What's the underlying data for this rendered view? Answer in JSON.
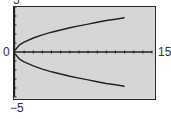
{
  "chart_data": {
    "type": "line",
    "title": "",
    "xlabel": "",
    "ylabel": "",
    "xlim": [
      0,
      15
    ],
    "ylim": [
      -5,
      5
    ],
    "x_tick_step": 1,
    "y_tick_step": 1,
    "grid": false,
    "window_labels": {
      "xmin": "0",
      "xmax": "15",
      "ymin": "−5",
      "ymax": "5"
    },
    "series": [
      {
        "name": "upper branch",
        "x": [
          0,
          0.5,
          1,
          2,
          3,
          4,
          5,
          6,
          7,
          8,
          9,
          10,
          11,
          12
        ],
        "values": [
          0.2,
          0.8,
          1.1,
          1.55,
          1.9,
          2.2,
          2.45,
          2.7,
          2.9,
          3.1,
          3.3,
          3.5,
          3.65,
          3.8
        ]
      },
      {
        "name": "lower branch",
        "x": [
          0,
          0.5,
          1,
          2,
          3,
          4,
          5,
          6,
          7,
          8,
          9,
          10,
          11,
          12
        ],
        "values": [
          -0.2,
          -0.8,
          -1.1,
          -1.55,
          -1.9,
          -2.2,
          -2.45,
          -2.7,
          -2.9,
          -3.1,
          -3.3,
          -3.5,
          -3.65,
          -3.8
        ]
      }
    ],
    "colors": {
      "background": "#d6d6d6",
      "frame": "#2a2a2a",
      "curve": "#222222",
      "axis": "#222222"
    }
  }
}
